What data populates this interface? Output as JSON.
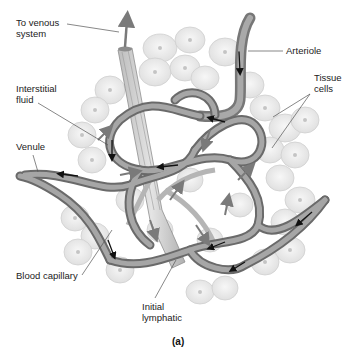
{
  "figure": {
    "caption": "(a)",
    "colors": {
      "background": "#ffffff",
      "tissue_cell_fill": "#ececec",
      "tissue_cell_stroke": "#c8c8c8",
      "vessel_fill": "#9a9a9a",
      "vessel_dark": "#5e5e5e",
      "lymphatic_fill": "#cfcfcf",
      "flow_arrow": "#111111",
      "fluid_arrow": "#7a7a7a",
      "label_text": "#222222",
      "leader_line": "#555555"
    }
  },
  "labels": {
    "to_venous_system": "To venous\nsystem",
    "arteriole": "Arteriole",
    "interstitial_fluid": "Interstitial\nfluid",
    "tissue_cells": "Tissue\ncells",
    "venule": "Venule",
    "blood_capillary": "Blood capillary",
    "initial_lymphatic": "Initial\nlymphatic"
  }
}
